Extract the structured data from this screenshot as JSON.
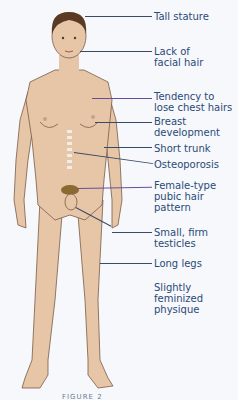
{
  "figure": {
    "skin_color": "#e6c6a6",
    "outline_color": "#7a5a48",
    "hair_color": "#5a3a22",
    "pubic_hair_color": "#8a6a30"
  },
  "labels": [
    {
      "id": "tall-stature",
      "text": "Tall stature",
      "top": 11
    },
    {
      "id": "facial-hair",
      "text": "Lack of\nfacial hair",
      "top": 46
    },
    {
      "id": "chest-hairs",
      "text": "Tendency to\nlose chest hairs",
      "top": 91
    },
    {
      "id": "breast",
      "text": "Breast\ndevelopment",
      "top": 116
    },
    {
      "id": "short-trunk",
      "text": "Short trunk",
      "top": 145
    },
    {
      "id": "osteoporosis",
      "text": "Osteoporosis",
      "top": 161
    },
    {
      "id": "pubic-hair",
      "text": "Female-type\npubic hair\npattern",
      "top": 180
    },
    {
      "id": "testicles",
      "text": "Small, firm\ntesticles",
      "top": 227
    },
    {
      "id": "long-legs",
      "text": "Long legs",
      "top": 259
    },
    {
      "id": "physique",
      "text": "Slightly\nfeminized\nphysique",
      "top": 282
    }
  ],
  "caption": "FIGURE 2"
}
